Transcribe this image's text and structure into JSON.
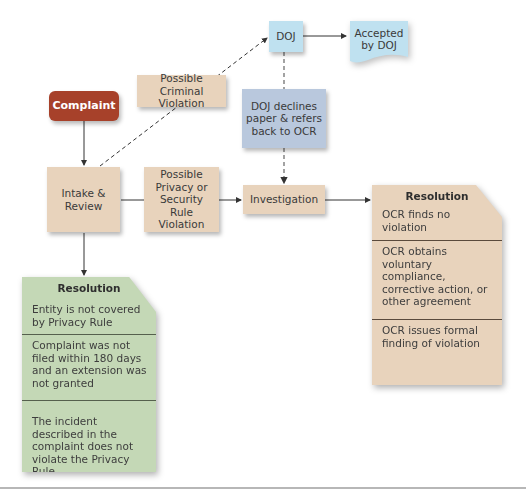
{
  "diagram": {
    "nodes": {
      "complaint": "Complaint",
      "intake": "Intake & Review",
      "criminal": "Possible Criminal Violation",
      "privacy": "Possible Privacy or Security Rule Violation",
      "doj": "DOJ",
      "accepted": "Accepted by DOJ",
      "doj_declines": "DOJ declines paper & refers back to OCR",
      "investigation": "Investigation"
    },
    "resolution_right": {
      "title": "Resolution",
      "items": [
        "OCR finds no violation",
        "OCR obtains voluntary compliance, corrective action, or other agreement",
        "OCR issues formal finding of violation"
      ]
    },
    "resolution_left": {
      "title": "Resolution",
      "items": [
        "Entity is not covered by Privacy Rule",
        "Complaint was not filed within 180 days and an extension was not granted",
        "The incident described in the complaint does not violate the Privacy Rule"
      ]
    },
    "colors": {
      "complaint": "#a7412a",
      "tan": "#e8d3bc",
      "light_blue": "#bfe1f0",
      "slate_blue": "#b9c8dd",
      "green": "#c4d8b6",
      "line": "#333333"
    },
    "edges": [
      {
        "from": "complaint",
        "to": "intake",
        "style": "solid"
      },
      {
        "from": "intake",
        "to": "doj",
        "via": "criminal",
        "style": "dashed"
      },
      {
        "from": "intake",
        "to": "investigation",
        "via": "privacy",
        "style": "solid"
      },
      {
        "from": "doj",
        "to": "accepted",
        "style": "solid"
      },
      {
        "from": "doj",
        "to": "investigation",
        "via": "doj_declines",
        "style": "dashed"
      },
      {
        "from": "investigation",
        "to": "resolution_right",
        "style": "solid"
      },
      {
        "from": "intake",
        "to": "resolution_left",
        "style": "solid"
      }
    ]
  }
}
